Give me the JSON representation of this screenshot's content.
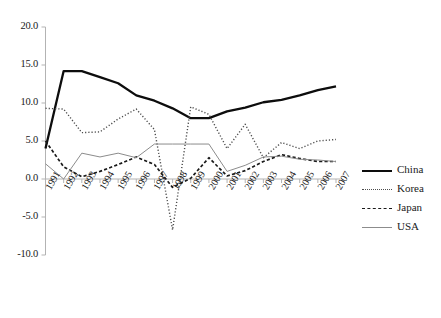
{
  "chart_data": {
    "type": "line",
    "title": "",
    "xlabel": "",
    "ylabel": "",
    "grid": false,
    "legend_position": "right",
    "ylim": [
      -10.0,
      20.0
    ],
    "yticks": [
      "20.0",
      "15.0",
      "10.0",
      "5.0",
      "0.0",
      "-5.0",
      "-10.0"
    ],
    "ytick_values": [
      20.0,
      15.0,
      10.0,
      5.0,
      0.0,
      -5.0,
      -10.0
    ],
    "categories": [
      "1991",
      "1992",
      "1993",
      "1994",
      "1995",
      "1996",
      "1997",
      "1998",
      "1999",
      "2000",
      "2001",
      "2002",
      "2003",
      "2004",
      "2005",
      "2006",
      "2007"
    ],
    "series": [
      {
        "name": "China",
        "style": "solid-thick",
        "color": "#0d0d0d",
        "values": [
          4.0,
          14.2,
          14.2,
          13.4,
          12.6,
          11.0,
          10.3,
          9.3,
          8.0,
          8.0,
          8.9,
          9.4,
          10.1,
          10.4,
          11.0,
          11.7,
          12.2
        ]
      },
      {
        "name": "Korea",
        "style": "dotted",
        "color": "#4d4d4d",
        "values": [
          9.3,
          9.2,
          6.1,
          6.2,
          7.9,
          9.2,
          6.5,
          -6.7,
          9.5,
          8.5,
          4.0,
          7.2,
          2.8,
          4.8,
          4.0,
          5.0,
          5.2
        ]
      },
      {
        "name": "Japan",
        "style": "dashed",
        "color": "#1a1a1a",
        "values": [
          5.0,
          1.6,
          0.3,
          1.0,
          1.9,
          2.9,
          1.9,
          -1.1,
          0.1,
          2.8,
          0.4,
          1.1,
          2.3,
          3.2,
          2.7,
          2.3,
          2.3
        ]
      },
      {
        "name": "USA",
        "style": "solid-thin",
        "color": "#8c8c8c",
        "values": [
          2.0,
          0.0,
          3.4,
          2.9,
          3.4,
          2.8,
          4.6,
          4.6,
          4.6,
          4.6,
          1.0,
          1.8,
          2.9,
          3.0,
          2.6,
          2.5,
          2.3
        ]
      }
    ]
  },
  "legend": {
    "entries": [
      {
        "label": "China"
      },
      {
        "label": "Korea"
      },
      {
        "label": "Japan"
      },
      {
        "label": "USA"
      }
    ]
  }
}
